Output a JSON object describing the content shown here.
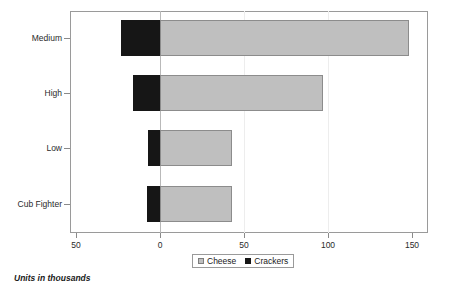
{
  "chart_data": {
    "type": "bar",
    "orientation": "horizontal",
    "stacked": "diverging",
    "title": "",
    "xlabel": "",
    "ylabel": "",
    "footnote": "Units in thousands",
    "categories": [
      "Medium",
      "High",
      "Low",
      "Cub Fighter"
    ],
    "series": [
      {
        "name": "Cheese",
        "color": "#bfbfbf",
        "values": [
          148,
          97,
          43,
          43
        ]
      },
      {
        "name": "Crackers",
        "color": "#161616",
        "values": [
          23,
          16,
          7,
          8
        ]
      }
    ],
    "legend": {
      "position": "bottom",
      "entries": [
        {
          "label": "Cheese",
          "color": "#bfbfbf"
        },
        {
          "label": "Crackers",
          "color": "#161616"
        }
      ]
    },
    "x_axis": {
      "tick_labels": [
        "50",
        "0",
        "50",
        "100",
        "150"
      ],
      "tick_values": [
        -50,
        0,
        50,
        100,
        150
      ],
      "xlim": [
        -53.6,
        159.5
      ],
      "grid": true
    },
    "y_axis": {
      "tick_labels": [
        "Medium",
        "High",
        "Low",
        "Cub Fighter"
      ]
    }
  }
}
